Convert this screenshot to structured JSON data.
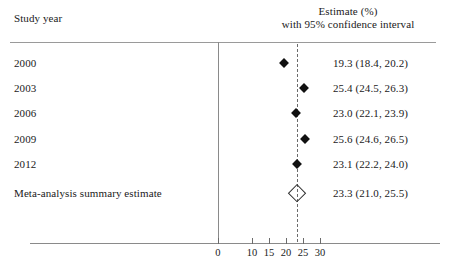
{
  "header": {
    "left_label": "Study year",
    "right_line1": "Estimate (%)",
    "right_line2": "with 95% confidence interval"
  },
  "axis": {
    "ticks": [
      {
        "label": "0",
        "value": 0
      },
      {
        "label": "10",
        "value": 10
      },
      {
        "label": "15",
        "value": 15
      },
      {
        "label": "20",
        "value": 20
      },
      {
        "label": "25",
        "value": 25
      },
      {
        "label": "30",
        "value": 30
      }
    ]
  },
  "reference_line_value": 23.3,
  "rows": [
    {
      "label": "2000",
      "estimate": 19.3,
      "low": 18.4,
      "high": 20.2,
      "text": "19.3 (18.4, 20.2)",
      "type": "study"
    },
    {
      "label": "2003",
      "estimate": 25.4,
      "low": 24.5,
      "high": 26.3,
      "text": "25.4 (24.5, 26.3)",
      "type": "study"
    },
    {
      "label": "2006",
      "estimate": 23.0,
      "low": 22.1,
      "high": 23.9,
      "text": "23.0 (22.1, 23.9)",
      "type": "study"
    },
    {
      "label": "2009",
      "estimate": 25.6,
      "low": 24.6,
      "high": 26.5,
      "text": "25.6 (24.6, 26.5)",
      "type": "study"
    },
    {
      "label": "2012",
      "estimate": 23.1,
      "low": 22.2,
      "high": 24.0,
      "text": "23.1 (22.2, 24.0)",
      "type": "study"
    },
    {
      "label": "Meta-analysis summary estimate",
      "estimate": 23.3,
      "low": 21.0,
      "high": 25.5,
      "text": "23.3 (21.0, 25.5)",
      "type": "summary"
    }
  ],
  "chart_data": {
    "type": "scatter",
    "title": "",
    "subtitle": "",
    "xlabel": "",
    "ylabel": "",
    "plot_style": "forest-plot",
    "categories": [
      "2000",
      "2003",
      "2006",
      "2009",
      "2012",
      "Meta-analysis summary estimate"
    ],
    "series": [
      {
        "name": "Estimate (%) with 95% confidence interval",
        "values": [
          19.3,
          25.4,
          23.0,
          25.6,
          23.1,
          23.3
        ],
        "ci_low": [
          18.4,
          24.5,
          22.1,
          24.6,
          22.2,
          21.0
        ],
        "ci_high": [
          20.2,
          26.3,
          23.9,
          26.5,
          24.0,
          25.5
        ]
      }
    ],
    "x_ticks": [
      0,
      10,
      15,
      20,
      25,
      30
    ],
    "x_tick_labels": [
      "0",
      "10",
      "15",
      "20",
      "25",
      "30"
    ],
    "axis_has_break": true,
    "reference_line": 23.3,
    "reference_line_style": "dashed",
    "grid": false,
    "legend": "none",
    "summary_marker": "open-diamond",
    "study_marker": "filled-diamond"
  }
}
